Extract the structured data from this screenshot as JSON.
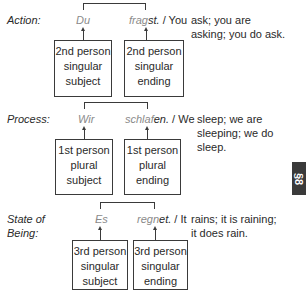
{
  "rows": [
    {
      "label_lines": [
        "Action:"
      ],
      "subject": "Du",
      "verb_stem": "frag",
      "verb_ending": "st.",
      "translation_lead": "/ You",
      "translation_lines": [
        "ask; you are",
        "asking; you do ask."
      ],
      "subject_box": [
        "2nd person",
        "singular",
        "subject"
      ],
      "ending_box": [
        "2nd person",
        "singular",
        "ending"
      ]
    },
    {
      "label_lines": [
        "Process:"
      ],
      "subject": "Wir",
      "verb_stem": "schlaf",
      "verb_ending": "en.",
      "translation_lead": "/ We",
      "translation_lines": [
        "sleep; we are",
        "sleeping; we do",
        "sleep."
      ],
      "subject_box": [
        "1st person",
        "plural",
        "subject"
      ],
      "ending_box": [
        "1st person",
        "plural",
        "ending"
      ]
    },
    {
      "label_lines": [
        "State of",
        "Being:"
      ],
      "subject": "Es",
      "verb_stem": "regn",
      "verb_ending": "et.",
      "translation_lead": "/ It",
      "translation_lines": [
        "rains; it is raining;",
        "it does rain."
      ],
      "subject_box": [
        "3rd person",
        "singular",
        "subject"
      ],
      "ending_box": [
        "3rd person",
        "singular",
        "ending"
      ]
    }
  ],
  "section_tab": "§8"
}
